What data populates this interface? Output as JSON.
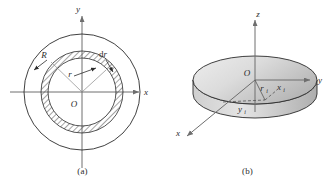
{
  "figure": {
    "background_color": "#ffffff",
    "line_color": "#2b2b2b",
    "axis_color": "#6e6e6e",
    "hatch_color": "#555555",
    "disk_fill_light": "#f0f0f0",
    "disk_fill_dark": "#b9b9b9"
  },
  "panel_a": {
    "caption": "(a)",
    "axes": {
      "x_label": "x",
      "y_label": "y",
      "origin_label": "O"
    },
    "labels": {
      "outer_radius": "R",
      "inner_radius": "r",
      "ring_width": "dr"
    },
    "geometry": {
      "outer_circle_radius_px": 58,
      "ring_inner_radius_px": 34,
      "ring_outer_radius_px": 41,
      "center_x_px": 82,
      "center_y_px": 92
    }
  },
  "panel_b": {
    "caption": "(b)",
    "axes": {
      "x_label": "x",
      "y_label": "y",
      "z_label": "z",
      "origin_label": "O"
    },
    "labels": {
      "radial_distance": "r",
      "radial_distance_sub": "i",
      "x_coordinate": "x",
      "x_coordinate_sub": "i",
      "y_coordinate": "y",
      "y_coordinate_sub": "i"
    },
    "geometry": {
      "disk_center_x_px": 90,
      "disk_center_y_px": 80,
      "disk_rx_px": 62,
      "disk_ry_px": 24,
      "disk_thickness_px": 14
    }
  }
}
